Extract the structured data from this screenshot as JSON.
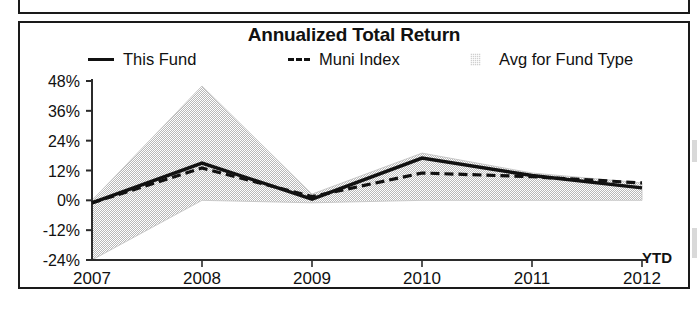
{
  "panel": {
    "title": "Annualized Total Return"
  },
  "legend": {
    "items": [
      {
        "label": "This Fund",
        "marker": "solid-line-swatch",
        "color": "#111111"
      },
      {
        "label": "Muni Index",
        "marker": "dashed-line-swatch",
        "color": "#111111"
      },
      {
        "label": "Avg for Fund Type",
        "marker": "shaded-area-swatch",
        "color": "#cfcfcf"
      }
    ]
  },
  "axis": {
    "ytd_note": "YTD"
  },
  "chart_data": {
    "type": "line",
    "title": "Annualized Total Return",
    "xlabel": "",
    "ylabel": "",
    "x": [
      "2007",
      "2008",
      "2009",
      "2010",
      "2011",
      "2012"
    ],
    "xtick_labels": [
      "2007",
      "2008",
      "2009",
      "2010",
      "2011",
      "2012"
    ],
    "ytick_labels": [
      "48%",
      "36%",
      "24%",
      "12%",
      "0%",
      "-12%",
      "-24%"
    ],
    "ytick_values": [
      48,
      36,
      24,
      12,
      0,
      -12,
      -24
    ],
    "ylim": [
      -24,
      48
    ],
    "grid": false,
    "legend_position": "top",
    "series": [
      {
        "name": "This Fund",
        "style": "solid",
        "color": "#111111",
        "values": [
          -1,
          15,
          0.5,
          17,
          10,
          5
        ]
      },
      {
        "name": "Muni Index",
        "style": "dashed",
        "color": "#111111",
        "values": [
          -1,
          13,
          1.5,
          11,
          9.5,
          7
        ]
      },
      {
        "name": "Avg for Fund Type",
        "style": "band",
        "color": "#cfcfcf",
        "band_high": [
          0,
          46,
          2.5,
          19,
          11,
          7
        ],
        "band_low": [
          -24,
          0,
          -1,
          0,
          0,
          0
        ]
      }
    ]
  }
}
